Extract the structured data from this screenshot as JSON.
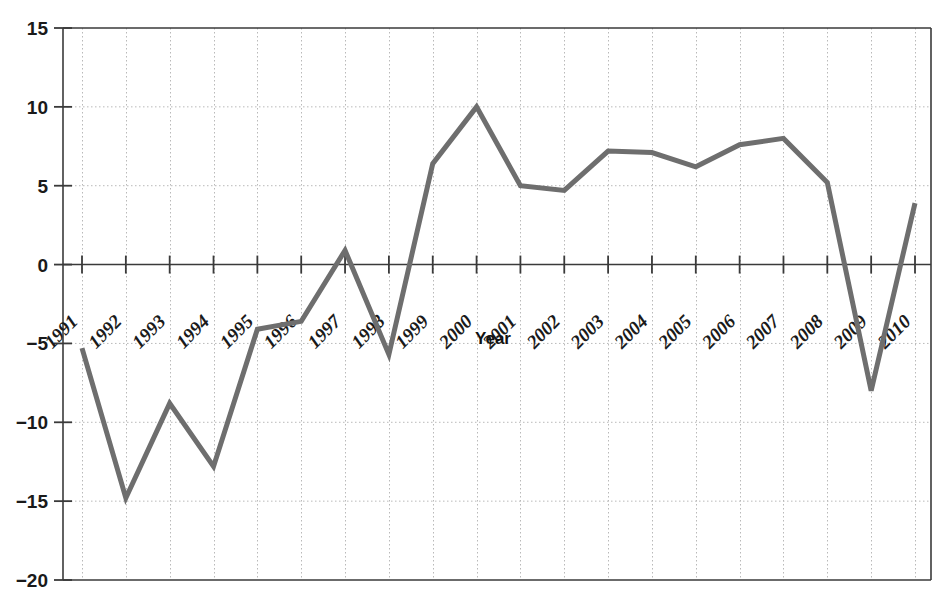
{
  "chart_data": {
    "type": "line",
    "title": "",
    "xlabel": "Year",
    "ylabel": "",
    "categories": [
      "1991",
      "1992",
      "1993",
      "1994",
      "1995",
      "1996",
      "1997",
      "1998",
      "1999",
      "2000",
      "2001",
      "2002",
      "2003",
      "2004",
      "2005",
      "2006",
      "2007",
      "2008",
      "2009",
      "2010"
    ],
    "values": [
      -5.3,
      -14.8,
      -8.8,
      -12.8,
      -4.1,
      -3.6,
      0.9,
      -5.7,
      6.4,
      10.0,
      5.0,
      4.7,
      7.2,
      7.1,
      6.2,
      7.6,
      8.0,
      5.2,
      -8.0,
      3.9
    ],
    "ylim": [
      -20,
      15
    ],
    "yticks": [
      15,
      10,
      5,
      0,
      -5,
      -10,
      -15,
      -20
    ],
    "ytick_labels": [
      "15",
      "10",
      "5",
      "0",
      "−5",
      "−10",
      "−15",
      "−20"
    ],
    "grid": true,
    "grid_style": "dotted",
    "legend": "none",
    "series_color": "#6e6e6e",
    "axis_color": "#3a3a3a",
    "grid_color": "#b9b9b9",
    "line_width": 5,
    "xtick_rotation": 45
  },
  "axis_titles": {
    "x": "Year"
  }
}
